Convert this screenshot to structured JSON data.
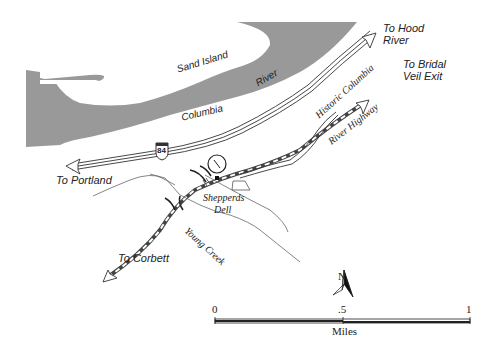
{
  "map": {
    "labels": {
      "sand_island": "Sand Island",
      "columbia": "Columbia",
      "river": "River",
      "to_hood_river_1": "To Hood",
      "to_hood_river_2": "River",
      "to_bridal_veil_1": "To Bridal",
      "to_bridal_veil_2": "Veil Exit",
      "historic_hwy_1": "Historic Columbia",
      "historic_hwy_2": "River Highway",
      "to_portland": "To Portland",
      "shepperds_dell_1": "Shepperds",
      "shepperds_dell_2": "Dell",
      "young_creek": "Young Creek",
      "to_corbett": "To Corbett",
      "interstate_shield": "84"
    },
    "north_arrow": {
      "label": "N"
    },
    "scale_bar": {
      "ticks": [
        "0",
        ".5",
        "1"
      ],
      "unit": "Miles"
    },
    "colors": {
      "water": "#999999",
      "road_dash": "#555555",
      "line": "#333333"
    }
  }
}
